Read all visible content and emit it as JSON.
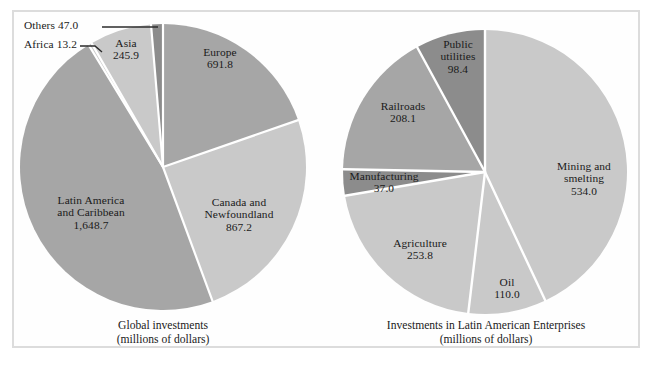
{
  "figure": {
    "background": "#ffffff",
    "frame_color": "#dcdcdc"
  },
  "colors": {
    "light_gray": "#c9c9c9",
    "mid_gray": "#a6a6a6",
    "dark_gray": "#8c8c8c",
    "separator": "#ffffff",
    "text": "#1a1a1a",
    "leader_line": "#2b2b2b"
  },
  "left_chart": {
    "caption_title": "Global investments",
    "caption_sub": "(millions of dollars)",
    "labels": {
      "europe_name": "Europe",
      "europe_value": "691.8",
      "canada_name_1": "Canada and",
      "canada_name_2": "Newfoundland",
      "canada_value": "867.2",
      "latin_name_1": "Latin America",
      "latin_name_2": "and Caribbean",
      "latin_value": "1,648.7",
      "asia_name": "Asia",
      "asia_value": "245.9",
      "africa_callout": "Africa  13.2",
      "others_callout": "Others  47.0"
    }
  },
  "right_chart": {
    "caption_title": "Investments in Latin American Enterprises",
    "caption_sub": "(millions of dollars)",
    "labels": {
      "mining_name_1": "Mining and",
      "mining_name_2": "smelting",
      "mining_value": "534.0",
      "oil_name": "Oil",
      "oil_value": "110.0",
      "agriculture_name": "Agriculture",
      "agriculture_value": "253.8",
      "manufacturing_name": "Manufacturing",
      "manufacturing_value": "37.0",
      "railroads_name": "Railroads",
      "railroads_value": "208.1",
      "utilities_name_1": "Public",
      "utilities_name_2": "utilities",
      "utilities_value": "98.4"
    }
  },
  "chart_data": [
    {
      "type": "pie",
      "title": "Global investments",
      "subtitle": "(millions of dollars)",
      "unit": "millions of dollars",
      "total": 3513.8,
      "legend_position": "inline-labels",
      "categories": [
        "Europe",
        "Canada and Newfoundland",
        "Latin America and Caribbean",
        "Africa",
        "Asia",
        "Others"
      ],
      "values": [
        691.8,
        867.2,
        1648.7,
        13.2,
        245.9,
        47.0
      ],
      "percentages": [
        19.7,
        24.7,
        46.9,
        0.4,
        7.0,
        1.3
      ],
      "slice_colors": [
        "#a6a6a6",
        "#c9c9c9",
        "#a6a6a6",
        "#c9c9c9",
        "#c9c9c9",
        "#8c8c8c"
      ],
      "start_angle_deg": 0,
      "direction": "clockwise",
      "callouts": [
        "Africa",
        "Others"
      ]
    },
    {
      "type": "pie",
      "title": "Investments in Latin American Enterprises",
      "subtitle": "(millions of dollars)",
      "unit": "millions of dollars",
      "total": 1241.3,
      "legend_position": "inline-labels",
      "categories": [
        "Mining and smelting",
        "Oil",
        "Agriculture",
        "Manufacturing",
        "Railroads",
        "Public utilities"
      ],
      "values": [
        534.0,
        110.0,
        253.8,
        37.0,
        208.1,
        98.4
      ],
      "percentages": [
        43.0,
        8.9,
        20.4,
        3.0,
        16.8,
        7.9
      ],
      "slice_colors": [
        "#c9c9c9",
        "#c9c9c9",
        "#c9c9c9",
        "#8c8c8c",
        "#a6a6a6",
        "#8c8c8c"
      ],
      "start_angle_deg": 0,
      "direction": "clockwise",
      "callouts": []
    }
  ]
}
